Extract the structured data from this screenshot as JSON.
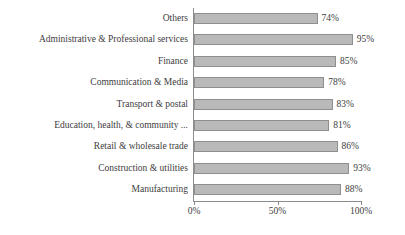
{
  "chart_data": {
    "type": "bar",
    "orientation": "horizontal",
    "title": "",
    "xlabel": "",
    "ylabel": "",
    "xlim": [
      0,
      100
    ],
    "xticks": [
      0,
      50,
      100
    ],
    "xtick_labels": [
      "0%",
      "50%",
      "100%"
    ],
    "grid": false,
    "legend": false,
    "bar_color": "#b9b9b9",
    "bar_border_color": "#8f8f8f",
    "axis_color": "#8c8c8c",
    "background": "#ffffff",
    "categories": [
      "Others",
      "Administrative & Professional services",
      "Finance",
      "Communication & Media",
      "Transport & postal",
      "Education, health, & community ...",
      "Retail & wholesale trade",
      "Construction & utilities",
      "Manufacturing"
    ],
    "values": [
      74,
      95,
      85,
      78,
      83,
      81,
      86,
      93,
      88
    ],
    "value_labels": [
      "74%",
      "95%",
      "85%",
      "78%",
      "83%",
      "81%",
      "86%",
      "93%",
      "88%"
    ]
  }
}
